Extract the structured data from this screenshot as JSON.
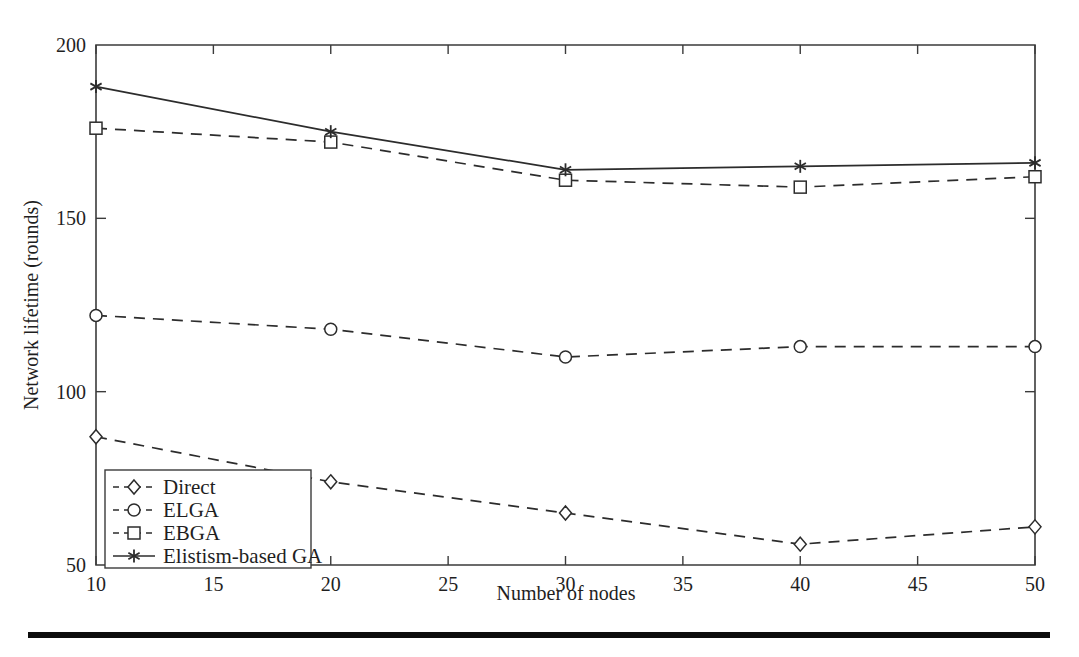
{
  "chart_data": {
    "type": "line",
    "title": "",
    "xlabel": "Number of nodes",
    "ylabel": "Network lifetime (rounds)",
    "x": [
      10,
      20,
      30,
      40,
      50
    ],
    "xlim": [
      10,
      50
    ],
    "ylim": [
      50,
      200
    ],
    "xticks": [
      10,
      15,
      20,
      25,
      30,
      35,
      40,
      45,
      50
    ],
    "yticks": [
      50,
      100,
      150,
      200
    ],
    "xtick_labels": [
      "10",
      "15",
      "20",
      "25",
      "30",
      "35",
      "40",
      "45",
      "50"
    ],
    "ytick_labels": [
      "50",
      "100",
      "150",
      "200"
    ],
    "grid": false,
    "legend_position": "lower left",
    "series": [
      {
        "name": "Direct",
        "marker": "diamond",
        "linestyle": "dashed",
        "values": [
          87,
          74,
          65,
          56,
          61
        ]
      },
      {
        "name": "ELGA",
        "marker": "circle",
        "linestyle": "dashed",
        "values": [
          122,
          118,
          110,
          113,
          113
        ]
      },
      {
        "name": "EBGA",
        "marker": "square",
        "linestyle": "dashed",
        "values": [
          176,
          172,
          161,
          159,
          162
        ]
      },
      {
        "name": "Elistism-based GA",
        "marker": "star",
        "linestyle": "solid",
        "values": [
          188,
          175,
          164,
          165,
          166
        ]
      }
    ]
  },
  "style": {
    "line_color": "#2c2c2c",
    "axis_color": "#3b3b3b",
    "text_color": "#1f1f1f",
    "background": "#ffffff",
    "rule_color": "#0d0d0d"
  },
  "footer": {
    "rule_present": "true"
  }
}
